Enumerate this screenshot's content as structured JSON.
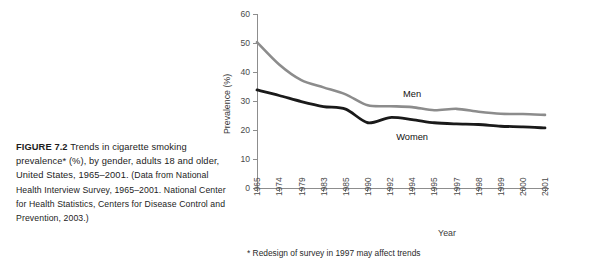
{
  "caption": {
    "label": "FIGURE 7.2",
    "title": "Trends in cigarette smoking prevalence* (%), by gender, adults 18 and older, United States, 1965–2001.",
    "source": "(Data from National Health Interview Survey, 1965–2001. National Center for Health Statistics, Centers for Disease Control and Prevention, 2003.)"
  },
  "chart_data": {
    "type": "line",
    "title": "",
    "subtitle": "",
    "xlabel": "Year",
    "ylabel": "Prevalence (%)",
    "ylim": [
      0,
      60
    ],
    "yticks": [
      0,
      10,
      20,
      30,
      40,
      50,
      60
    ],
    "grid": false,
    "legend_position": "inline-labels",
    "categories": [
      "1965",
      "1974",
      "1979",
      "1983",
      "1985",
      "1990",
      "1992",
      "1994",
      "1995",
      "1997",
      "1998",
      "1999",
      "2000",
      "2001"
    ],
    "series": [
      {
        "name": "Men",
        "color": "#8c8c8c",
        "values": [
          50.3,
          42.6,
          37.2,
          34.7,
          32.3,
          28.5,
          28.2,
          27.9,
          26.8,
          27.3,
          26.3,
          25.6,
          25.5,
          25.2
        ]
      },
      {
        "name": "Women",
        "color": "#1a1a1a",
        "values": [
          33.8,
          31.9,
          29.8,
          28.1,
          27.2,
          22.5,
          24.3,
          23.6,
          22.5,
          22.1,
          21.9,
          21.3,
          21.1,
          20.7
        ]
      }
    ],
    "annotations": [
      {
        "text": "Men",
        "x": "1994",
        "y": 31.5
      },
      {
        "text": "Women",
        "x": "1994",
        "y": 16.5
      }
    ],
    "footnote": "* Redesign of survey in 1997 may affect trends"
  }
}
